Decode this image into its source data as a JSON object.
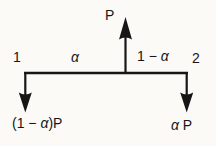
{
  "colors": {
    "background": "#fbfaf7",
    "ink": "#161616"
  },
  "diagram": {
    "force_label": "P",
    "node_left": "1",
    "node_right": "2",
    "span_left_alpha": "α",
    "span_right": {
      "pre": "1 − ",
      "alpha": "α"
    },
    "reaction_left": {
      "pre": "(1 − ",
      "alpha": "α",
      "post": ")P"
    },
    "reaction_right": {
      "alpha": "α",
      "post": " P"
    }
  }
}
